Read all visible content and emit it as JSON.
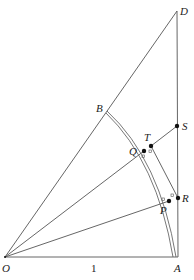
{
  "diagram": {
    "points": {
      "O": {
        "label": "O",
        "x": 5,
        "y": 257
      },
      "A": {
        "label": "A",
        "x": 178,
        "y": 257
      },
      "D": {
        "label": "D",
        "x": 177,
        "y": 11
      },
      "B": {
        "label": "B",
        "x": 107,
        "y": 109
      },
      "S": {
        "label": "S",
        "x": 177,
        "y": 126
      },
      "T": {
        "label": "T",
        "x": 151,
        "y": 146
      },
      "Q": {
        "label": "Q",
        "x": 144,
        "y": 151
      },
      "R": {
        "label": "R",
        "x": 178,
        "y": 198
      },
      "P": {
        "label": "P",
        "x": 169,
        "y": 201
      }
    },
    "segment_label": "1",
    "colors": {
      "line": "#555555",
      "dot": "#111111",
      "text": "#222222"
    }
  }
}
